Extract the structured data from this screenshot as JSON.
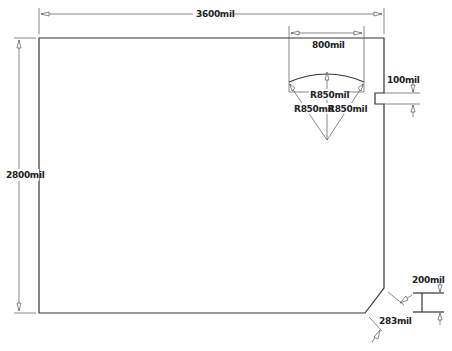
{
  "drawing": {
    "type": "PCB board outline with dimensions",
    "units": "mil",
    "colors": {
      "outline": "#333333",
      "dimension": "#555555",
      "background": "#ffffff"
    },
    "dimensions": {
      "width": "3600mil",
      "height": "2800mil",
      "cutout_width": "800mil",
      "radius_center": "R850mil",
      "radius_left": "R850mil",
      "radius_right": "R850mil",
      "slot_height": "100mil",
      "chamfer": "283mil",
      "edge_offset": "200mil"
    }
  }
}
